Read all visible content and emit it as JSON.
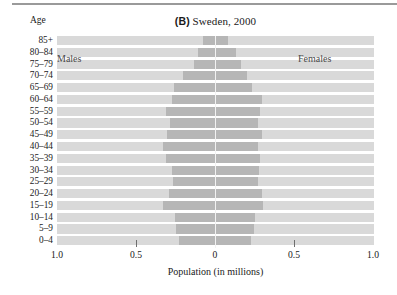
{
  "figure": {
    "panel_tag": "(B)",
    "title_text": "Sweden, 2000",
    "age_axis_caption": "Age"
  },
  "chart_data": {
    "type": "bar",
    "orientation": "horizontal",
    "subtype": "population-pyramid",
    "title": "(B) Sweden, 2000",
    "xlabel": "Population (in millions)",
    "ylabel": "Age",
    "grid": false,
    "legend_position": "in-plot",
    "xlim": [
      -1.0,
      1.0
    ],
    "xticks": [
      -1.0,
      -0.5,
      0,
      0.5,
      1.0
    ],
    "xtick_labels": [
      "1.0",
      "0.5",
      "0",
      "0.5",
      "1.0"
    ],
    "categories": [
      "85+",
      "80–84",
      "75–79",
      "70–74",
      "65–69",
      "60–64",
      "55–59",
      "50–54",
      "45–49",
      "40–44",
      "35–39",
      "30–34",
      "25–29",
      "20–24",
      "15–19",
      "10–14",
      "5–9",
      "0–4"
    ],
    "series": [
      {
        "name": "Males",
        "color": "#b6b6b6",
        "side": "left",
        "values": [
          0.075,
          0.105,
          0.135,
          0.205,
          0.26,
          0.27,
          0.31,
          0.285,
          0.305,
          0.33,
          0.31,
          0.272,
          0.265,
          0.292,
          0.33,
          0.253,
          0.247,
          0.228
        ]
      },
      {
        "name": "Females",
        "color": "#b6b6b6",
        "side": "right",
        "values": [
          0.08,
          0.13,
          0.162,
          0.205,
          0.237,
          0.3,
          0.285,
          0.272,
          0.295,
          0.272,
          0.285,
          0.278,
          0.272,
          0.297,
          0.303,
          0.256,
          0.247,
          0.228
        ]
      }
    ],
    "background_color": "#d9d9d9",
    "bar_color": "#b6b6b6"
  },
  "labels": {
    "males": "Males",
    "females": "Females",
    "x_axis_title": "Population (in millions)"
  }
}
